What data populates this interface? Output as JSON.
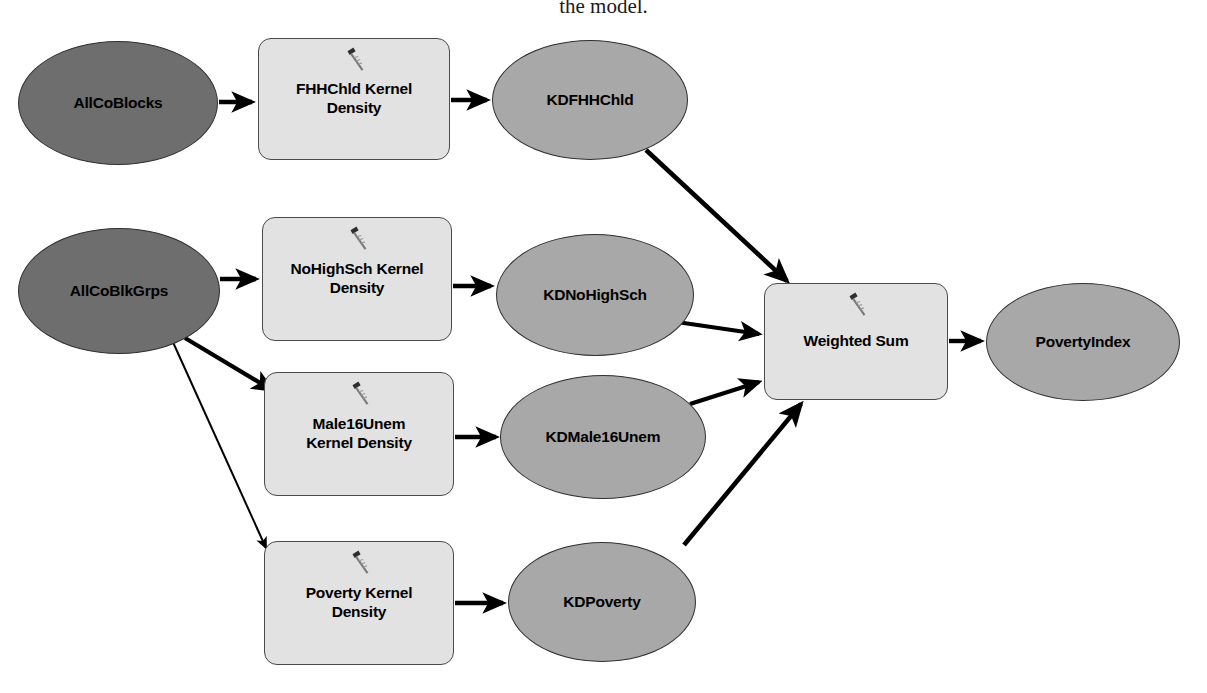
{
  "caption": "the model.",
  "diagram": {
    "type": "arcgis-modelbuilder-workflow",
    "colors": {
      "input_fill": "#6e6e6e",
      "derived_fill": "#a8a8a8",
      "process_fill": "#e2e2e2",
      "stroke": "#303030",
      "edge": "#000000",
      "background": "#ffffff"
    },
    "nodes": [
      {
        "id": "allcoblocks",
        "label": "AllCoBlocks",
        "shape": "ellipse",
        "role": "input-data",
        "x": 18,
        "y": 41,
        "w": 200,
        "h": 124
      },
      {
        "id": "fhhchld_kd",
        "label": "FHHChld Kernel\nDensity",
        "shape": "rounded-rect",
        "role": "tool",
        "icon": "hammer-tool-icon",
        "x": 258,
        "y": 38,
        "w": 192,
        "h": 122
      },
      {
        "id": "kdfhhchld",
        "label": "KDFHHChld",
        "shape": "ellipse",
        "role": "derived-data",
        "x": 492,
        "y": 40,
        "w": 196,
        "h": 120
      },
      {
        "id": "allcoblkgrps",
        "label": "AllCoBlkGrps",
        "shape": "ellipse",
        "role": "input-data",
        "x": 18,
        "y": 228,
        "w": 202,
        "h": 126
      },
      {
        "id": "nohighsch_kd",
        "label": "NoHighSch Kernel\nDensity",
        "shape": "rounded-rect",
        "role": "tool",
        "icon": "hammer-tool-icon",
        "x": 262,
        "y": 217,
        "w": 190,
        "h": 124
      },
      {
        "id": "kdnohighsch",
        "label": "KDNoHighSch",
        "shape": "ellipse",
        "role": "derived-data",
        "x": 496,
        "y": 234,
        "w": 198,
        "h": 122
      },
      {
        "id": "male16unem_kd",
        "label": "Male16Unem\nKernel Density",
        "shape": "rounded-rect",
        "role": "tool",
        "icon": "hammer-tool-icon",
        "x": 264,
        "y": 372,
        "w": 190,
        "h": 124
      },
      {
        "id": "kdmale16unem",
        "label": "KDMale16Unem",
        "shape": "ellipse",
        "role": "derived-data",
        "x": 500,
        "y": 375,
        "w": 206,
        "h": 124
      },
      {
        "id": "poverty_kd",
        "label": "Poverty Kernel\nDensity",
        "shape": "rounded-rect",
        "role": "tool",
        "icon": "hammer-tool-icon",
        "x": 264,
        "y": 541,
        "w": 190,
        "h": 124
      },
      {
        "id": "kdpoverty",
        "label": "KDPoverty",
        "shape": "ellipse",
        "role": "derived-data",
        "x": 508,
        "y": 542,
        "w": 188,
        "h": 120
      },
      {
        "id": "weighted_sum",
        "label": "Weighted Sum",
        "shape": "rounded-rect",
        "role": "tool",
        "icon": "hammer-tool-icon",
        "x": 764,
        "y": 283,
        "w": 184,
        "h": 117
      },
      {
        "id": "povertyindex",
        "label": "PovertyIndex",
        "shape": "ellipse",
        "role": "derived-data",
        "x": 986,
        "y": 283,
        "w": 194,
        "h": 118
      }
    ],
    "edges": [
      {
        "from": "allcoblocks",
        "to": "fhhchld_kd",
        "style": "thick"
      },
      {
        "from": "fhhchld_kd",
        "to": "kdfhhchld",
        "style": "thick"
      },
      {
        "from": "kdfhhchld",
        "to": "weighted_sum",
        "style": "thick"
      },
      {
        "from": "allcoblkgrps",
        "to": "nohighsch_kd",
        "style": "thick"
      },
      {
        "from": "nohighsch_kd",
        "to": "kdnohighsch",
        "style": "thick"
      },
      {
        "from": "kdnohighsch",
        "to": "weighted_sum",
        "style": "thick"
      },
      {
        "from": "allcoblkgrps",
        "to": "male16unem_kd",
        "style": "thick"
      },
      {
        "from": "male16unem_kd",
        "to": "kdmale16unem",
        "style": "thick"
      },
      {
        "from": "kdmale16unem",
        "to": "weighted_sum",
        "style": "thick"
      },
      {
        "from": "allcoblkgrps",
        "to": "poverty_kd",
        "style": "thin"
      },
      {
        "from": "poverty_kd",
        "to": "kdpoverty",
        "style": "thick"
      },
      {
        "from": "kdpoverty",
        "to": "weighted_sum",
        "style": "thick"
      },
      {
        "from": "weighted_sum",
        "to": "povertyindex",
        "style": "thick"
      }
    ]
  }
}
